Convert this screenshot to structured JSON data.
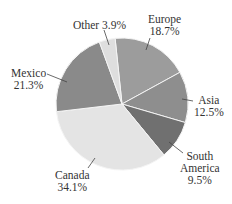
{
  "chart_data": {
    "type": "pie",
    "title": "",
    "categories": [
      "Europe",
      "Asia",
      "South America",
      "Canada",
      "Mexico",
      "Other"
    ],
    "values": [
      18.7,
      12.5,
      9.5,
      34.1,
      21.3,
      3.9
    ],
    "unit": "%",
    "colors": [
      "#9c9c9c",
      "#8e8e8e",
      "#707070",
      "#e4e4e4",
      "#8a8a8a",
      "#dedede"
    ],
    "start_angle_deg": -6,
    "direction": "clockwise",
    "legend": "none (direct labels with leader lines)",
    "labels": [
      {
        "name": "Europe",
        "value": "18.7%"
      },
      {
        "name": "Asia",
        "value": "12.5%"
      },
      {
        "name": "South America",
        "value": "9.5%"
      },
      {
        "name": "Canada",
        "value": "34.1%"
      },
      {
        "name": "Mexico",
        "value": "21.3%"
      },
      {
        "name": "Other",
        "value": "3.9%"
      }
    ]
  },
  "labels": {
    "europe": {
      "name": "Europe",
      "value": "18.7%"
    },
    "asia": {
      "name": "Asia",
      "value": "12.5%"
    },
    "south_america": {
      "name1": "South",
      "name2": "America",
      "value": "9.5%"
    },
    "canada": {
      "name": "Canada",
      "value": "34.1%"
    },
    "mexico": {
      "name": "Mexico",
      "value": "21.3%"
    },
    "other": {
      "text": "Other 3.9%"
    }
  }
}
